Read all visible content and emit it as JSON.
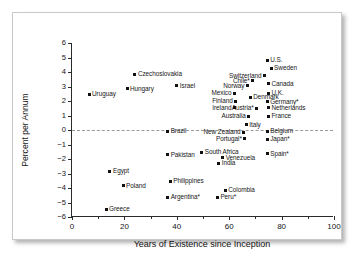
{
  "chart_data": {
    "type": "scatter",
    "title": "",
    "xlabel": "Years of Existence since Inception",
    "ylabel": "Percent per Annum",
    "xlim": [
      0,
      100
    ],
    "ylim": [
      -6,
      6
    ],
    "xticks": [
      0,
      20,
      40,
      60,
      80,
      100
    ],
    "xtick_labels": [
      "0",
      "20",
      "40",
      "60",
      "80",
      "100"
    ],
    "xminor_ticks": [
      10,
      30,
      50,
      70,
      90
    ],
    "yticks": [
      6,
      5,
      4,
      3,
      2,
      1,
      0,
      -1,
      -2,
      -3,
      -4,
      -5,
      -6
    ],
    "ytick_labels": [
      "6",
      "5",
      "4",
      "3",
      "2",
      "1",
      "0",
      "−1",
      "−2",
      "−3",
      "−4",
      "−5",
      "−6"
    ],
    "grid": false,
    "zero_reference_line": 0,
    "legend": "none",
    "marker_color": "#111111",
    "points": [
      {
        "label": "Uruguay",
        "x": 6.5,
        "y": 2.45,
        "side": "l"
      },
      {
        "label": "Hungary",
        "x": 21.0,
        "y": 2.85,
        "side": "l"
      },
      {
        "label": "Czechoslovakia",
        "x": 24.0,
        "y": 3.85,
        "side": "l"
      },
      {
        "label": "Israel",
        "x": 40.0,
        "y": 3.05,
        "side": "l"
      },
      {
        "label": "Egypt",
        "x": 14.5,
        "y": -2.85,
        "side": "l"
      },
      {
        "label": "Poland",
        "x": 19.5,
        "y": -3.85,
        "side": "l"
      },
      {
        "label": "Greece",
        "x": 13.0,
        "y": -5.45,
        "side": "l"
      },
      {
        "label": "Brazil",
        "x": 36.5,
        "y": -0.1,
        "side": "l"
      },
      {
        "label": "Pakistan",
        "x": 36.5,
        "y": -1.7,
        "side": "l"
      },
      {
        "label": "Philippines",
        "x": 37.5,
        "y": -3.55,
        "side": "l"
      },
      {
        "label": "Argentina*",
        "x": 36.5,
        "y": -4.65,
        "side": "l"
      },
      {
        "label": "South Africa",
        "x": 49.5,
        "y": -1.55,
        "side": "l"
      },
      {
        "label": "Peru*",
        "x": 55.5,
        "y": -4.65,
        "side": "l"
      },
      {
        "label": "Colombia",
        "x": 58.5,
        "y": -4.15,
        "side": "l"
      },
      {
        "label": "India",
        "x": 56.0,
        "y": -2.3,
        "side": "l"
      },
      {
        "label": "Venezuela",
        "x": 57.5,
        "y": -1.9,
        "side": "l"
      },
      {
        "label": "New Zealand",
        "x": 65.5,
        "y": -0.15,
        "side": "r"
      },
      {
        "label": "Portugal*",
        "x": 66.0,
        "y": -0.6,
        "side": "r"
      },
      {
        "label": "Italy",
        "x": 66.5,
        "y": 0.35,
        "side": "l"
      },
      {
        "label": "Australia",
        "x": 67.5,
        "y": 0.95,
        "side": "r"
      },
      {
        "label": "Belgium",
        "x": 74.5,
        "y": -0.1,
        "side": "l"
      },
      {
        "label": "Japan*",
        "x": 74.5,
        "y": -0.65,
        "side": "l"
      },
      {
        "label": "Spain*",
        "x": 74.5,
        "y": -1.65,
        "side": "l"
      },
      {
        "label": "France",
        "x": 75.0,
        "y": 0.95,
        "side": "l"
      },
      {
        "label": "Netherlands",
        "x": 75.0,
        "y": 1.55,
        "side": "l"
      },
      {
        "label": "Germany*",
        "x": 74.5,
        "y": 1.95,
        "side": "l"
      },
      {
        "label": "U.K.",
        "x": 75.0,
        "y": 2.55,
        "side": "l"
      },
      {
        "label": "Canada",
        "x": 75.0,
        "y": 3.2,
        "side": "l"
      },
      {
        "label": "Switzerland",
        "x": 73.5,
        "y": 3.75,
        "side": "r"
      },
      {
        "label": "Sweden",
        "x": 76.0,
        "y": 4.25,
        "side": "l"
      },
      {
        "label": "U.S.",
        "x": 74.5,
        "y": 4.8,
        "side": "l"
      },
      {
        "label": "Austria*",
        "x": 70.5,
        "y": 1.5,
        "side": "r"
      },
      {
        "label": "Denmark",
        "x": 68.0,
        "y": 2.25,
        "side": "l"
      },
      {
        "label": "Chile*",
        "x": 69.0,
        "y": 3.4,
        "side": "r"
      },
      {
        "label": "Norway",
        "x": 67.0,
        "y": 3.05,
        "side": "r"
      },
      {
        "label": "Mexico",
        "x": 62.0,
        "y": 2.55,
        "side": "r"
      },
      {
        "label": "Finland",
        "x": 62.5,
        "y": 2.0,
        "side": "r"
      },
      {
        "label": "Ireland",
        "x": 62.0,
        "y": 1.55,
        "side": "r"
      }
    ]
  }
}
